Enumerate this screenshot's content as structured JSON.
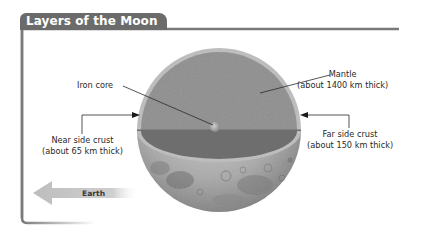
{
  "title": "Layers of the Moon",
  "labels": {
    "iron_core": {
      "name": "Iron core"
    },
    "mantle": {
      "name": "Mantle",
      "detail": "(about 1400 km thick)"
    },
    "near_side_crust": {
      "name": "Near side crust",
      "detail": "(about 65 km thick)"
    },
    "far_side_crust": {
      "name": "Far side crust",
      "detail": "(about 150 km thick)"
    }
  },
  "earth_arrow": {
    "label": "Earth",
    "direction": "left"
  },
  "colors": {
    "frame": "#7a7a7a",
    "title_tab": "#6b6b6b",
    "mantle": "#8e8e8e",
    "cut_band": "#6e6e6e",
    "crust_rim": "#b8b8b8",
    "core": "#a9a9a9",
    "arrow": "#c8c8c8"
  }
}
